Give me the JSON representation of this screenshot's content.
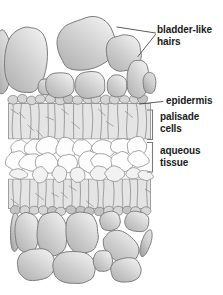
{
  "figure": {
    "labels": {
      "bladder_hairs": "bladder-like\nhairs",
      "epidermis": "epidermis",
      "palisade": "palisade\ncells",
      "aqueous": "aqueous\ntissue"
    },
    "colors": {
      "background": "#ffffff",
      "hair_light": "#f1f1f1",
      "hair_mid": "#cecece",
      "hair_dark": "#aeaeae",
      "hair_dark2": "#9a9a9a",
      "outline": "#7d7d7d",
      "palisade_fill": "#e4e4e4",
      "epidermis_fill": "#d6d6d6",
      "epidermis_dark": "#c3c3c3",
      "aqueous_fill": "#fdfdfd",
      "wall": "#8b8b8b",
      "label_text": "#1b1b1b",
      "leader": "#4a4a4a",
      "bracket": "#7a7a7a"
    }
  }
}
